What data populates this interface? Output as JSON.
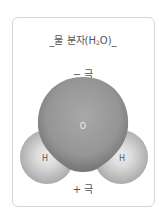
{
  "title": {
    "prefix": "_물 분자(H",
    "subscript": "2",
    "suffix": "O)_"
  },
  "poles": {
    "negative": "− 극",
    "positive": "+ 극"
  },
  "atoms": {
    "oxygen": "O",
    "hydrogen_left": "H",
    "hydrogen_right": "H"
  },
  "colors": {
    "oxygen_center": "#a4a4a4",
    "oxygen_edge": "#7a7a7a",
    "hydrogen_center": "#e6e6e6",
    "hydrogen_edge": "#a9a9a9",
    "border": "#d6d6d6"
  }
}
